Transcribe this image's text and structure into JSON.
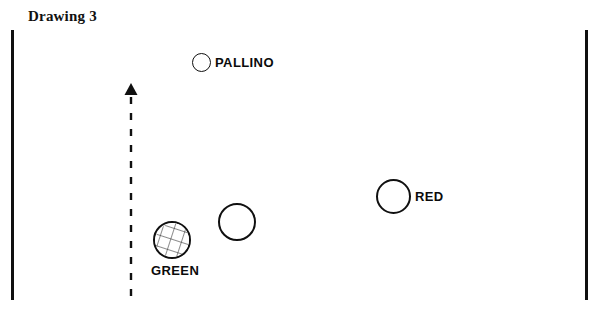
{
  "title": "Drawing 3",
  "colors": {
    "ink": "#101010",
    "background": "#ffffff"
  },
  "court": {
    "left_sideline_name": "left-court-sideline",
    "right_sideline_name": "right-court-sideline"
  },
  "balls": [
    {
      "label": "PALLINO",
      "type": "target-ball",
      "fill": "open",
      "cx": 201,
      "cy": 62,
      "r": 9
    },
    {
      "label": "",
      "type": "boule",
      "fill": "open",
      "cx": 237,
      "cy": 222,
      "r": 19
    },
    {
      "label": "GREEN",
      "type": "boule",
      "fill": "cross-hatched",
      "cx": 172,
      "cy": 240,
      "r": 19
    },
    {
      "label": "RED",
      "type": "boule",
      "fill": "open",
      "cx": 393,
      "cy": 196,
      "r": 17
    }
  ],
  "arrow": {
    "name": "direction-of-play-arrow",
    "style": "dashed",
    "direction": "up",
    "x": 131,
    "y_top": 83,
    "y_bottom": 300
  }
}
